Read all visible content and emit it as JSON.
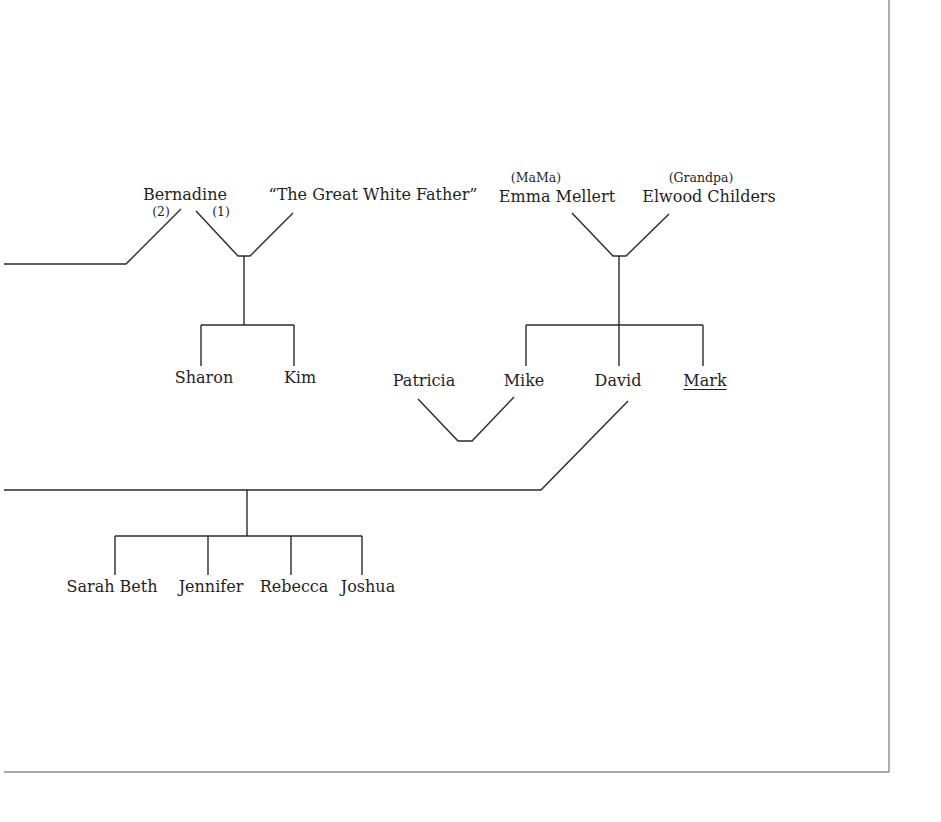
{
  "diagram": {
    "type": "family-tree",
    "colors": {
      "line": "#2a2a2a",
      "frame": "#8a8a8a",
      "text": "#1f1f1f",
      "background": "#ffffff"
    },
    "people": {
      "bernadine": {
        "name": "Bernadine",
        "x": 185,
        "y": 187
      },
      "great_white_father": {
        "name": "“The Great White Father”",
        "x": 373,
        "y": 187
      },
      "emma": {
        "name": "Emma Mellert",
        "nickname": "(MaMa)",
        "x": 557,
        "y": 187,
        "nick_x": 536
      },
      "elwood": {
        "name": "Elwood Childers",
        "nickname": "(Grandpa)",
        "x": 709,
        "y": 187,
        "nick_x": 701
      },
      "sharon": {
        "name": "Sharon",
        "x": 204,
        "y": 370
      },
      "kim": {
        "name": "Kim",
        "x": 300,
        "y": 370
      },
      "patricia": {
        "name": "Patricia",
        "x": 424,
        "y": 373
      },
      "mike": {
        "name": "Mike",
        "x": 524,
        "y": 373
      },
      "david": {
        "name": "David",
        "x": 618,
        "y": 373
      },
      "mark": {
        "name": "Mark",
        "x": 705,
        "y": 373,
        "underlined": true
      },
      "sarah_beth": {
        "name": "Sarah Beth",
        "x": 114,
        "y": 578
      },
      "jennifer": {
        "name": "Jennifer",
        "x": 211,
        "y": 578
      },
      "rebecca": {
        "name": "Rebecca",
        "x": 293,
        "y": 578
      },
      "joshua": {
        "name": "Joshua",
        "x": 368,
        "y": 578
      }
    },
    "marriage_labels": {
      "second": {
        "text": "(2)",
        "x": 161,
        "y": 206
      },
      "first": {
        "text": "(1)",
        "x": 221,
        "y": 206
      }
    },
    "relationships": [
      {
        "type": "marriage",
        "order": "(2)",
        "spouses": [
          "Bernadine",
          "(off-page partner)"
        ]
      },
      {
        "type": "marriage",
        "order": "(1)",
        "spouses": [
          "Bernadine",
          "“The Great White Father”"
        ],
        "children": [
          "Sharon",
          "Kim"
        ]
      },
      {
        "type": "marriage",
        "spouses": [
          "Emma Mellert",
          "Elwood Childers"
        ],
        "children": [
          "Mike",
          "David",
          "Mark"
        ]
      },
      {
        "type": "marriage",
        "spouses": [
          "Patricia",
          "Mike"
        ]
      },
      {
        "type": "marriage",
        "spouses": [
          "David",
          "(off-page partner)"
        ],
        "children": [
          "Sarah Beth",
          "Jennifer",
          "Rebecca",
          "Joshua"
        ]
      }
    ]
  }
}
